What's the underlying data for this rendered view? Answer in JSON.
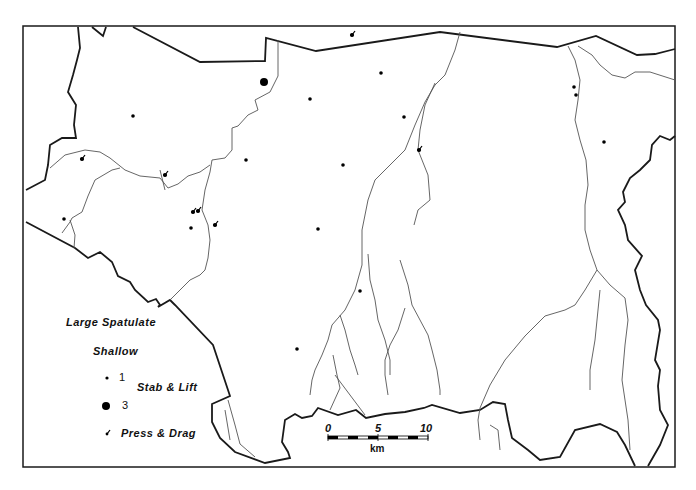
{
  "map": {
    "legend": {
      "title": "Large Spatulate",
      "subtitle": "Shallow",
      "items": [
        {
          "symbol": "small-dot",
          "value": "1"
        },
        {
          "symbol": "large-dot",
          "value": "3"
        },
        {
          "symbol": "tick",
          "label": "Press & Drag"
        }
      ],
      "group_label": "Stab & Lift"
    },
    "scale_bar": {
      "ticks": [
        "0",
        "5",
        "10"
      ],
      "unit": "km"
    },
    "colors": {
      "boundary": "#1a1a1a",
      "river": "#555555",
      "point": "#000000",
      "background": "#ffffff"
    }
  }
}
